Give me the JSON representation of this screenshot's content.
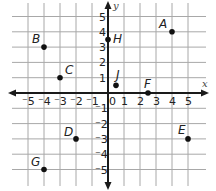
{
  "chart_data": {
    "type": "scatter",
    "title": "",
    "xlabel": "x",
    "ylabel": "y",
    "xlim": [
      -5,
      5
    ],
    "ylim": [
      -5,
      5
    ],
    "grid": true,
    "x_ticks": [
      "-5",
      "-4",
      "-3",
      "-2",
      "-1",
      "0",
      "1",
      "2",
      "3",
      "4",
      "5"
    ],
    "y_ticks": [
      "5",
      "4",
      "3",
      "2",
      "1",
      "-1",
      "-2",
      "-3",
      "-4",
      "-5"
    ],
    "points": [
      {
        "label": "A",
        "x": 4,
        "y": 4
      },
      {
        "label": "B",
        "x": -4,
        "y": 3
      },
      {
        "label": "C",
        "x": -3,
        "y": 1
      },
      {
        "label": "D",
        "x": -2,
        "y": -3
      },
      {
        "label": "E",
        "x": 5,
        "y": -3
      },
      {
        "label": "F",
        "x": 2.5,
        "y": 0
      },
      {
        "label": "G",
        "x": -4,
        "y": -5
      },
      {
        "label": "H",
        "x": 0,
        "y": 3.5
      },
      {
        "label": "J",
        "x": 0.5,
        "y": 0.5
      }
    ]
  },
  "axes": {
    "x_label": "x",
    "y_label": "y",
    "origin_label": "0"
  }
}
